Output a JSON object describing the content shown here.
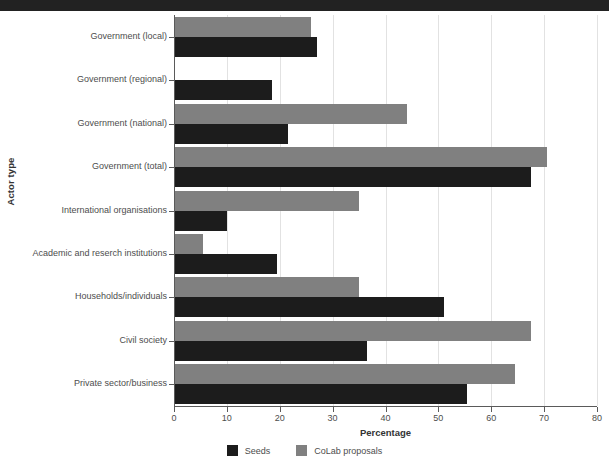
{
  "window": {
    "titlebar_color": "#222222"
  },
  "chart_data": {
    "type": "bar",
    "orientation": "horizontal",
    "title": "",
    "xlabel": "Percentage",
    "ylabel": "Actor type",
    "xlim": [
      0,
      80
    ],
    "xticks": [
      0,
      10,
      20,
      30,
      40,
      50,
      60,
      70,
      80
    ],
    "xtick_labels": [
      "0",
      "10",
      "20",
      "30",
      "40",
      "50",
      "60",
      "70",
      "80"
    ],
    "grid": "vertical",
    "legend_position": "bottom",
    "categories": [
      "Government (local)",
      "Government (regional)",
      "Government (national)",
      "Government (total)",
      "International organisations",
      "Academic and reserch institutions",
      "Households/individuals",
      "Civil society",
      "Private sector/business"
    ],
    "series": [
      {
        "name": "Seeds",
        "color": "#1c1c1c",
        "values": [
          27,
          18.5,
          21.5,
          67.5,
          10,
          19.5,
          51,
          36.5,
          55.5
        ]
      },
      {
        "name": "CoLab proposals",
        "color": "#808080",
        "values": [
          26,
          0,
          44,
          70.5,
          35,
          5.5,
          35,
          67.5,
          64.5
        ]
      }
    ]
  }
}
